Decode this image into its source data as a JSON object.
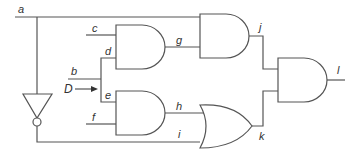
{
  "diagram": {
    "type": "logic-circuit",
    "colors": {
      "line": "#555555",
      "text": "#333333",
      "background": "#ffffff"
    },
    "labels": {
      "a": "a",
      "b": "b",
      "c": "c",
      "d": "d",
      "e": "e",
      "f": "f",
      "g": "g",
      "h": "h",
      "i": "i",
      "j": "j",
      "k": "k",
      "l": "l",
      "D": "D"
    },
    "gates": [
      {
        "id": "and1",
        "type": "AND",
        "inputs": [
          "c",
          "d"
        ],
        "output": "g"
      },
      {
        "id": "and2",
        "type": "AND",
        "inputs": [
          "e",
          "f"
        ],
        "output": "h"
      },
      {
        "id": "and3",
        "type": "AND",
        "inputs": [
          "a",
          "g"
        ],
        "output": "j"
      },
      {
        "id": "or1",
        "type": "OR",
        "inputs": [
          "h",
          "i"
        ],
        "output": "k"
      },
      {
        "id": "and4",
        "type": "AND",
        "inputs": [
          "j",
          "k"
        ],
        "output": "l"
      },
      {
        "id": "not1",
        "type": "NOT",
        "inputs": [
          "a"
        ],
        "output": "i"
      }
    ],
    "annotations": [
      {
        "label": "D",
        "description": "arrow pointing at the junction of b feeding d and e"
      }
    ]
  }
}
